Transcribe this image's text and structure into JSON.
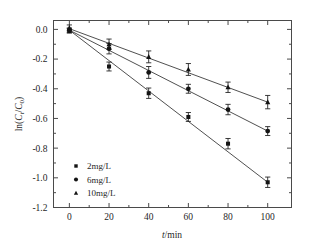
{
  "chart_data": {
    "type": "scatter",
    "title": "",
    "xlabel": "t/min",
    "ylabel": "ln(Ct/C0)",
    "xlabel_parts": {
      "italic": "t",
      "rest": "/min"
    },
    "ylabel_parts": {
      "prefix": "ln(",
      "c1": "C",
      "sub1": "t",
      "slash": "/",
      "c2": "C",
      "sub2": "0",
      "suffix": ")"
    },
    "x": [
      0,
      20,
      40,
      60,
      80,
      100
    ],
    "xlim": [
      -8,
      112
    ],
    "ylim": [
      -1.2,
      0.06
    ],
    "xticks": [
      0,
      20,
      40,
      60,
      80,
      100
    ],
    "yticks": [
      0.0,
      -0.2,
      -0.4,
      -0.6,
      -0.8,
      -1.0,
      -1.2
    ],
    "xtick_labels": [
      "0",
      "20",
      "40",
      "60",
      "80",
      "100"
    ],
    "ytick_labels": [
      "0.0",
      "-0.2",
      "-0.4",
      "-0.6",
      "-0.8",
      "-1.0",
      "-1.2"
    ],
    "minor_ticks_per_interval": 1,
    "grid": false,
    "legend_position": "lower-left-inside",
    "series": [
      {
        "name": "2mg/L",
        "marker": "square",
        "color": "#141414",
        "values": [
          -0.01,
          -0.25,
          -0.43,
          -0.59,
          -0.77,
          -1.03
        ],
        "errors": [
          0.015,
          0.03,
          0.035,
          0.03,
          0.035,
          0.035
        ],
        "fit_from": [
          0,
          -0.005
        ],
        "fit_to": [
          100,
          -1.03
        ]
      },
      {
        "name": "6mg/L",
        "marker": "circle",
        "color": "#141414",
        "values": [
          -0.005,
          -0.13,
          -0.29,
          -0.4,
          -0.54,
          -0.685
        ],
        "errors": [
          0.015,
          0.035,
          0.04,
          0.03,
          0.035,
          0.03
        ],
        "fit_from": [
          0,
          -0.005
        ],
        "fit_to": [
          100,
          -0.685
        ]
      },
      {
        "name": "10mg/L",
        "marker": "triangle",
        "color": "#141414",
        "values": [
          0.01,
          -0.1,
          -0.185,
          -0.27,
          -0.39,
          -0.49
        ],
        "errors": [
          0.02,
          0.035,
          0.04,
          0.04,
          0.035,
          0.045
        ],
        "fit_from": [
          0,
          0.005
        ],
        "fit_to": [
          100,
          -0.49
        ]
      }
    ]
  },
  "legend": {
    "items": [
      {
        "label": "2mg/L",
        "marker": "square"
      },
      {
        "label": "6mg/L",
        "marker": "circle"
      },
      {
        "label": "10mg/L",
        "marker": "triangle"
      }
    ]
  }
}
